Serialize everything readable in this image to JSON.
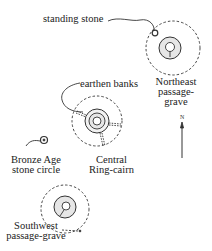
{
  "diagram": {
    "labels": {
      "standing_stone": "standing stone",
      "northeast": [
        "Northeast",
        "passage-",
        "grave"
      ],
      "earthen_banks": "earthen banks",
      "bronze_age": [
        "Bronze Age",
        "stone circle"
      ],
      "central": [
        "Central",
        "Ring-cairn"
      ],
      "southwest": [
        "Southwest",
        "passage-grave"
      ],
      "north": "N"
    },
    "colors": {
      "ink": "#333333",
      "fill": "#e6e6e6"
    }
  }
}
